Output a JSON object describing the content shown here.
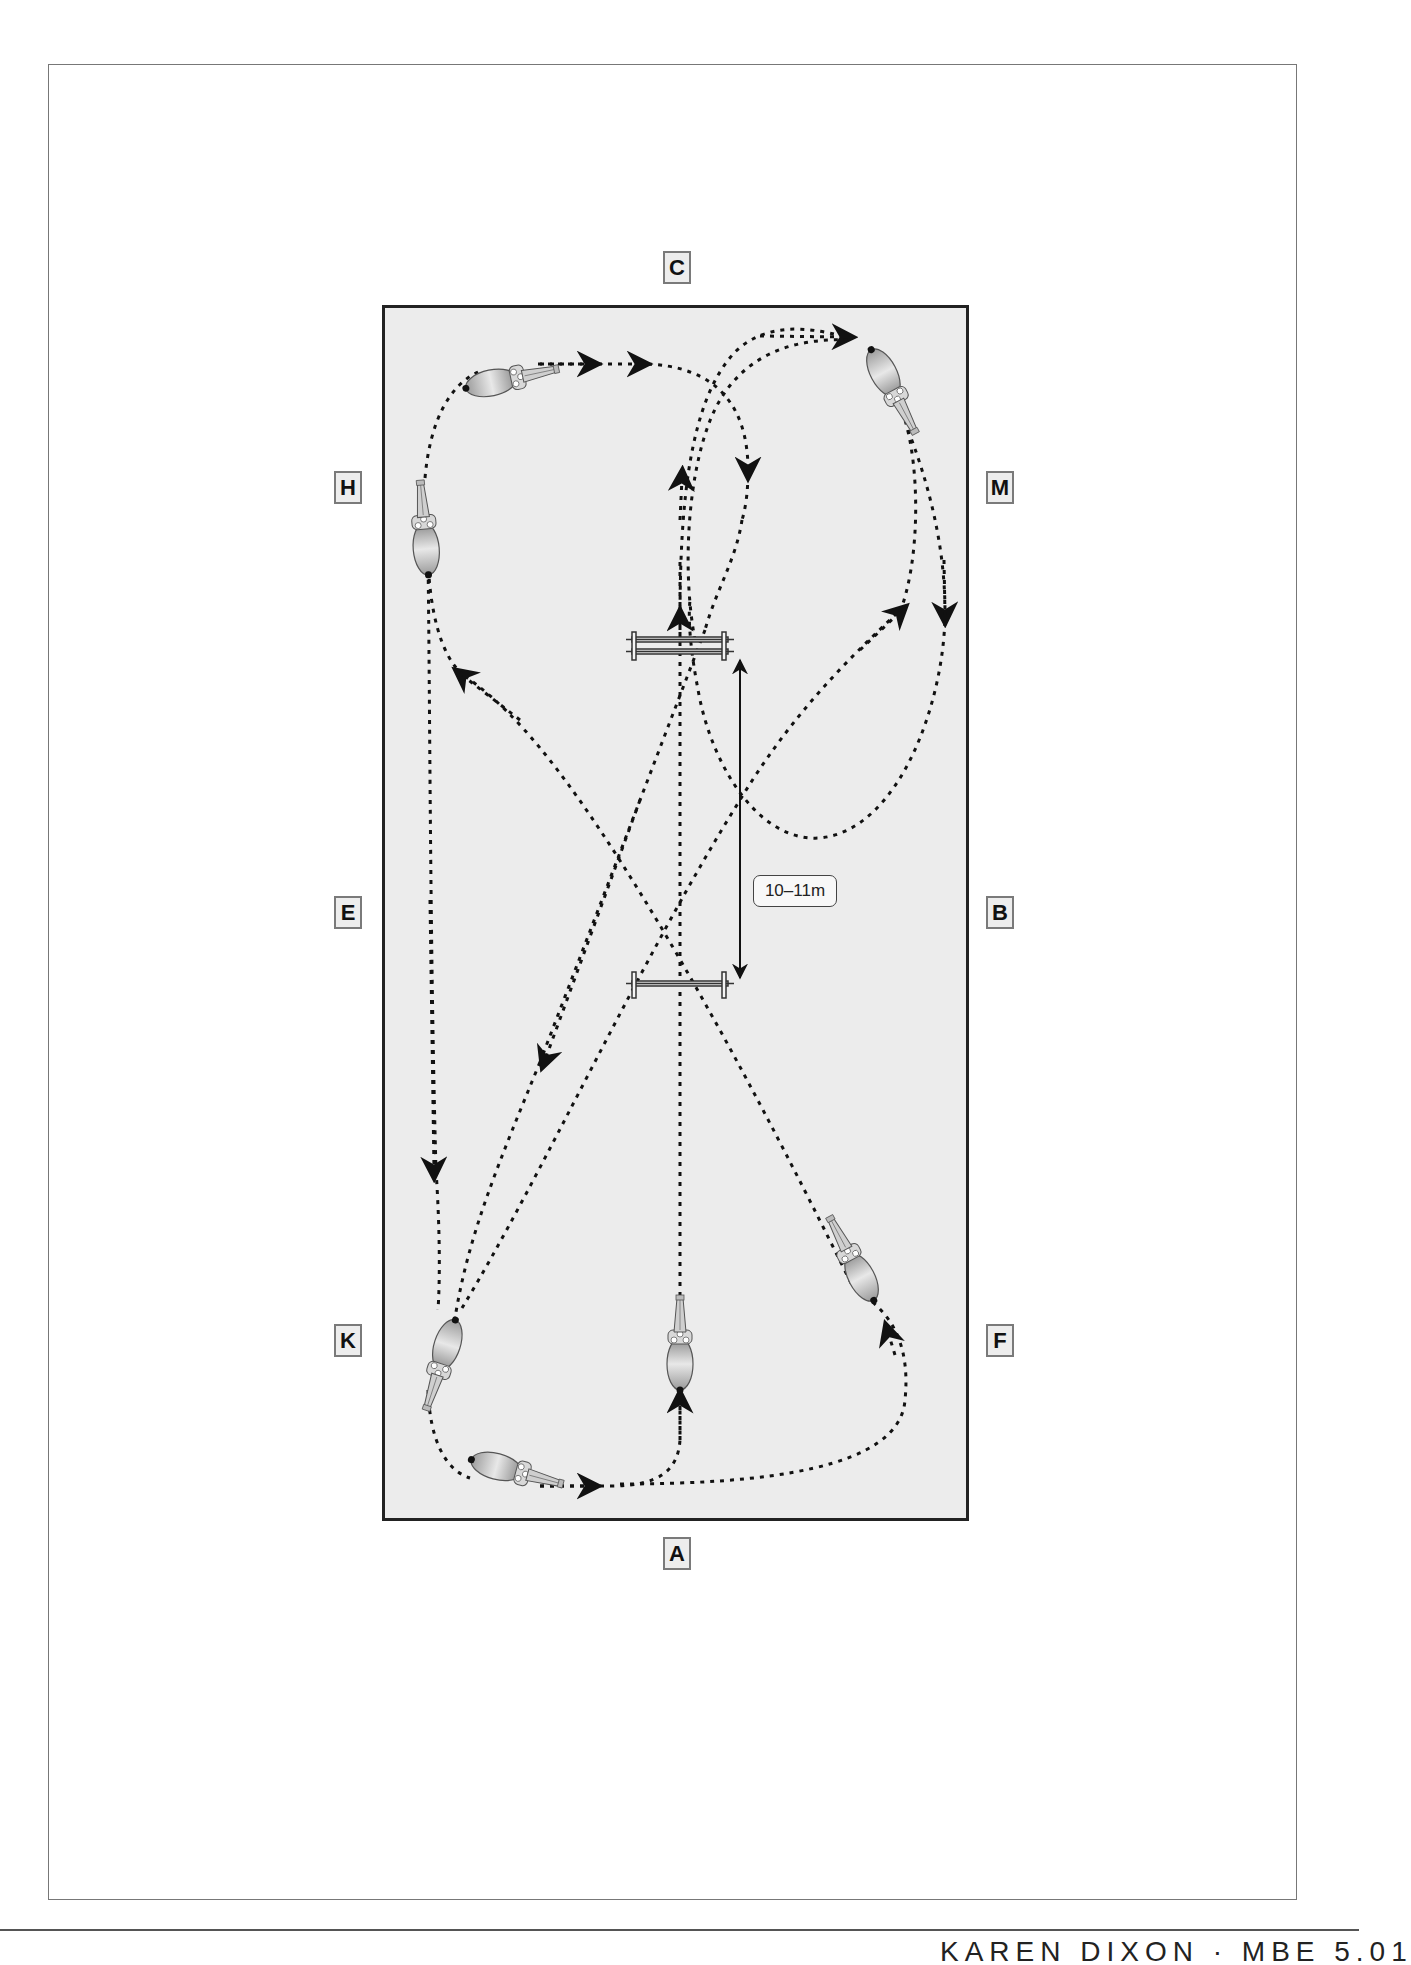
{
  "diagram": {
    "arena": {
      "x": 382,
      "y": 305,
      "width": 587,
      "height": 1216,
      "fill": "#ececec",
      "border": "#222222"
    },
    "markers": [
      {
        "letter": "C",
        "x": 663,
        "y": 251
      },
      {
        "letter": "H",
        "x": 334,
        "y": 471
      },
      {
        "letter": "M",
        "x": 986,
        "y": 471
      },
      {
        "letter": "E",
        "x": 334,
        "y": 896
      },
      {
        "letter": "B",
        "x": 986,
        "y": 896
      },
      {
        "letter": "K",
        "x": 334,
        "y": 1324
      },
      {
        "letter": "F",
        "x": 986,
        "y": 1324
      },
      {
        "letter": "A",
        "x": 663,
        "y": 1537
      }
    ],
    "fences": [
      {
        "name": "fence-1-double-poles",
        "y": [
          640,
          652
        ]
      },
      {
        "name": "fence-2-single-pole",
        "y": [
          983
        ]
      }
    ],
    "distance_label": "10–11m",
    "horses": [
      {
        "position": "top-left",
        "heading": "right"
      },
      {
        "position": "H side",
        "heading": "up"
      },
      {
        "position": "top-right",
        "heading": "down"
      },
      {
        "position": "K side",
        "heading": "down"
      },
      {
        "position": "bottom-left",
        "heading": "right"
      },
      {
        "position": "centre-line near A",
        "heading": "up"
      },
      {
        "position": "F side",
        "heading": "up-left"
      }
    ]
  },
  "footer": {
    "text": "KAREN DIXON · MBE 5.01"
  }
}
